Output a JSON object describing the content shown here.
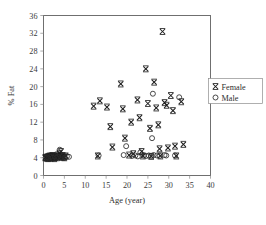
{
  "chart_data": {
    "type": "scatter",
    "title": "",
    "xlabel": "Age (year)",
    "ylabel": "% Fat",
    "xlim": [
      0,
      40
    ],
    "ylim": [
      0,
      36
    ],
    "xticks": [
      0,
      5,
      10,
      15,
      20,
      25,
      30,
      35,
      40
    ],
    "yticks": [
      0,
      4,
      8,
      12,
      16,
      20,
      24,
      28,
      32,
      36
    ],
    "grid": false,
    "legend_position": "right-outside",
    "series": [
      {
        "name": "Female",
        "marker": "x-star",
        "color": "#1c1c1c",
        "points": [
          [
            0.4,
            4.0
          ],
          [
            0.6,
            4.1
          ],
          [
            0.8,
            3.9
          ],
          [
            1.0,
            4.2
          ],
          [
            1.1,
            3.8
          ],
          [
            1.3,
            4.3
          ],
          [
            1.5,
            4.0
          ],
          [
            1.6,
            4.4
          ],
          [
            1.8,
            3.9
          ],
          [
            2.0,
            4.2
          ],
          [
            2.1,
            4.5
          ],
          [
            2.3,
            4.0
          ],
          [
            2.5,
            4.3
          ],
          [
            2.6,
            3.8
          ],
          [
            2.8,
            4.1
          ],
          [
            3.0,
            4.4
          ],
          [
            3.2,
            4.0
          ],
          [
            3.4,
            4.6
          ],
          [
            3.6,
            4.2
          ],
          [
            3.8,
            5.0
          ],
          [
            4.0,
            4.3
          ],
          [
            4.2,
            5.4
          ],
          [
            4.4,
            4.1
          ],
          [
            4.6,
            4.5
          ],
          [
            4.8,
            4.2
          ],
          [
            5.0,
            4.0
          ],
          [
            5.3,
            4.4
          ],
          [
            12.0,
            15.6
          ],
          [
            13.0,
            4.4
          ],
          [
            13.5,
            16.8
          ],
          [
            15.2,
            15.4
          ],
          [
            16.0,
            11.0
          ],
          [
            16.5,
            6.4
          ],
          [
            18.5,
            20.6
          ],
          [
            19.0,
            15.0
          ],
          [
            19.5,
            8.4
          ],
          [
            20.5,
            4.6
          ],
          [
            21.0,
            12.0
          ],
          [
            21.5,
            4.9
          ],
          [
            22.5,
            17.0
          ],
          [
            23.0,
            13.0
          ],
          [
            23.5,
            5.4
          ],
          [
            23.8,
            4.4
          ],
          [
            24.5,
            24.0
          ],
          [
            25.0,
            16.2
          ],
          [
            25.5,
            10.6
          ],
          [
            25.8,
            4.3
          ],
          [
            26.5,
            21.0
          ],
          [
            27.0,
            15.2
          ],
          [
            27.5,
            11.4
          ],
          [
            27.8,
            6.0
          ],
          [
            28.0,
            4.4
          ],
          [
            28.5,
            32.4
          ],
          [
            29.0,
            16.4
          ],
          [
            29.5,
            15.8
          ],
          [
            29.8,
            6.2
          ],
          [
            30.5,
            18.0
          ],
          [
            31.0,
            14.6
          ],
          [
            31.5,
            6.6
          ],
          [
            31.8,
            4.4
          ],
          [
            33.0,
            16.6
          ],
          [
            33.5,
            7.0
          ]
        ]
      },
      {
        "name": "Male",
        "marker": "circle-open",
        "color": "#2a2a2a",
        "points": [
          [
            0.5,
            4.0
          ],
          [
            0.9,
            4.1
          ],
          [
            1.2,
            3.9
          ],
          [
            1.7,
            4.2
          ],
          [
            2.2,
            4.0
          ],
          [
            2.7,
            4.3
          ],
          [
            3.1,
            4.0
          ],
          [
            3.5,
            4.2
          ],
          [
            3.9,
            5.8
          ],
          [
            4.3,
            4.1
          ],
          [
            4.7,
            4.4
          ],
          [
            5.1,
            4.0
          ],
          [
            5.6,
            4.3
          ],
          [
            6.1,
            4.2
          ],
          [
            13.2,
            4.5
          ],
          [
            19.2,
            4.6
          ],
          [
            19.8,
            6.6
          ],
          [
            21.2,
            4.4
          ],
          [
            22.0,
            4.5
          ],
          [
            22.6,
            4.3
          ],
          [
            23.2,
            5.2
          ],
          [
            24.0,
            4.5
          ],
          [
            24.6,
            4.4
          ],
          [
            25.2,
            4.5
          ],
          [
            25.8,
            4.4
          ],
          [
            26.4,
            4.6
          ],
          [
            27.2,
            4.5
          ],
          [
            27.8,
            4.4
          ],
          [
            26.0,
            8.4
          ],
          [
            26.2,
            18.4
          ],
          [
            29.0,
            4.6
          ],
          [
            29.4,
            4.5
          ],
          [
            31.5,
            4.5
          ],
          [
            32.5,
            17.6
          ]
        ]
      }
    ]
  },
  "legend": {
    "entries": [
      {
        "label": "Female",
        "marker": "x-star"
      },
      {
        "label": "Male",
        "marker": "circle-open"
      }
    ]
  }
}
